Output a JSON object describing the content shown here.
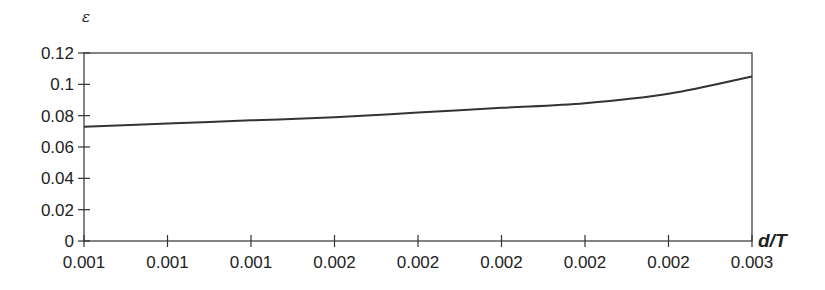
{
  "chart_data": {
    "type": "line",
    "title": "",
    "xlabel": "d/T",
    "ylabel": "ε",
    "categories": [
      "0.001",
      "0.001",
      "0.001",
      "0.002",
      "0.002",
      "0.002",
      "0.002",
      "0.002",
      "0.003"
    ],
    "series": [
      {
        "name": "ε",
        "values": [
          0.073,
          0.075,
          0.077,
          0.079,
          0.082,
          0.085,
          0.088,
          0.094,
          0.105
        ]
      }
    ],
    "ylim": [
      0,
      0.12
    ],
    "yticks": [
      "0",
      "0.02",
      "0.04",
      "0.06",
      "0.08",
      "0.1",
      "0.12"
    ],
    "grid": false,
    "legend": "none"
  },
  "colors": {
    "line": "#333333",
    "axis": "#333333"
  }
}
